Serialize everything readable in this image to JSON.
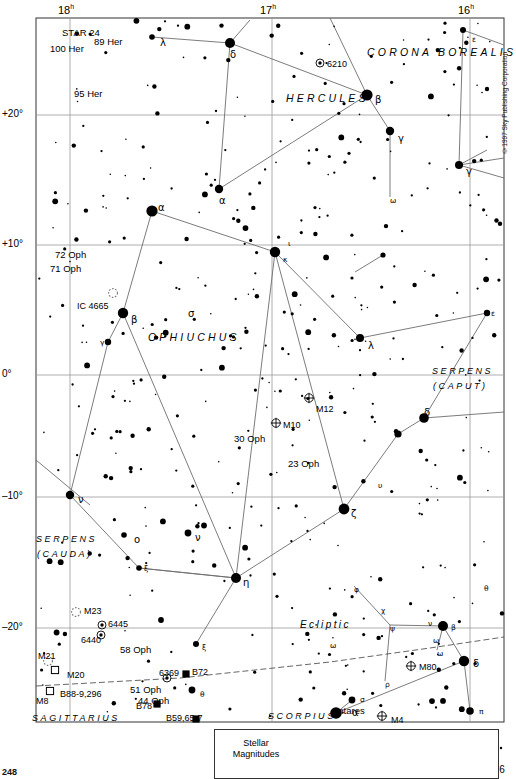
{
  "meta": {
    "copyright": "©1997 Sky Publishing Corporation",
    "page_number": "248"
  },
  "chart_data": {
    "type": "scatter",
    "xlabel": "Right Ascension",
    "ylabel": "Declination",
    "xlim": [
      "18h",
      "16h"
    ],
    "ylim": [
      -24,
      26
    ],
    "grid": true,
    "legend_position": "bottom",
    "ra_ticks": [
      {
        "label": "18",
        "unit": "h",
        "x": 70
      },
      {
        "label": "17",
        "unit": "h",
        "x": 272
      },
      {
        "label": "16",
        "unit": "h",
        "x": 470
      }
    ],
    "dec_ticks": [
      {
        "label": "+20°",
        "y": 115
      },
      {
        "label": "+10°",
        "y": 245
      },
      {
        "label": "0°",
        "y": 375
      },
      {
        "label": "–10°",
        "y": 497
      },
      {
        "label": "–20°",
        "y": 628
      }
    ],
    "magnitude_legend": {
      "title_line1": "Stellar",
      "title_line2": "Magnitudes",
      "entries": [
        {
          "label": "–1",
          "radius": 11.5,
          "cx": 296
        },
        {
          "label": "0",
          "radius": 8.0,
          "cx": 341
        },
        {
          "label": "1",
          "radius": 6.2,
          "cx": 381
        },
        {
          "label": "2",
          "radius": 4.6,
          "cx": 417
        },
        {
          "label": "3",
          "radius": 3.4,
          "cx": 448
        },
        {
          "label": "4",
          "radius": 2.4,
          "cx": 472
        },
        {
          "label": "5",
          "radius": 1.7,
          "cx": 489
        },
        {
          "label": "6",
          "radius": 1.2,
          "cx": 501
        }
      ]
    },
    "constellation_names": [
      {
        "name": "CORONA BOREALIS",
        "x": 367,
        "y": 47,
        "size": "normal"
      },
      {
        "name": "HERCULES",
        "x": 286,
        "y": 93,
        "size": "normal"
      },
      {
        "name": "OPHIUCHUS",
        "x": 148,
        "y": 332,
        "size": "normal"
      },
      {
        "name": "SERPENS",
        "x": 432,
        "y": 367,
        "size": "small"
      },
      {
        "name": "(CAPUT)",
        "x": 433,
        "y": 382,
        "size": "small"
      },
      {
        "name": "SERPENS",
        "x": 36,
        "y": 535,
        "size": "small"
      },
      {
        "name": "(CAUDA)",
        "x": 37,
        "y": 550,
        "size": "small"
      },
      {
        "name": "SAGITTARIUS",
        "x": 32,
        "y": 714,
        "size": "small"
      },
      {
        "name": "SCORPIUS",
        "x": 268,
        "y": 712,
        "size": "small"
      },
      {
        "name": "Ecliptic",
        "x": 300,
        "y": 620,
        "size": "ecliptic"
      }
    ],
    "named_stars": [
      {
        "name": "STAR 24",
        "x": 62,
        "y": 28
      },
      {
        "name": "89 Her",
        "x": 94,
        "y": 37
      },
      {
        "name": "100 Her",
        "x": 50,
        "y": 44
      },
      {
        "name": "95 Her",
        "x": 74,
        "y": 89
      },
      {
        "name": "72 Oph",
        "x": 55,
        "y": 250
      },
      {
        "name": "71 Oph",
        "x": 50,
        "y": 264
      },
      {
        "name": "30 Oph",
        "x": 234,
        "y": 434
      },
      {
        "name": "23 Oph",
        "x": 288,
        "y": 459
      },
      {
        "name": "58 Oph",
        "x": 120,
        "y": 645
      },
      {
        "name": "51 Oph",
        "x": 130,
        "y": 685
      },
      {
        "name": "44 Oph",
        "x": 138,
        "y": 696
      },
      {
        "name": "Antares",
        "x": 332,
        "y": 706
      }
    ],
    "deep_sky_objects": [
      {
        "name": "6210",
        "type": "planetary",
        "x": 320,
        "y": 63,
        "lx": 327,
        "ly": 60
      },
      {
        "name": "IC 4665",
        "type": "open-dotted",
        "x": 113,
        "y": 293,
        "lx": 77,
        "ly": 302
      },
      {
        "name": "M12",
        "type": "globular",
        "x": 309,
        "y": 398,
        "lx": 316,
        "ly": 405
      },
      {
        "name": "M10",
        "type": "globular",
        "x": 276,
        "y": 423,
        "lx": 283,
        "ly": 421
      },
      {
        "name": "M23",
        "type": "open-dotted",
        "x": 76,
        "y": 612,
        "lx": 84,
        "ly": 607
      },
      {
        "name": "6445",
        "type": "planetary",
        "x": 102,
        "y": 625,
        "lx": 108,
        "ly": 620
      },
      {
        "name": "6440",
        "type": "planetary",
        "x": 101,
        "y": 635,
        "lx": 81,
        "ly": 636
      },
      {
        "name": "M21",
        "type": "open-dotted",
        "x": 48,
        "y": 661,
        "lx": 38,
        "ly": 652
      },
      {
        "name": "M20",
        "type": "nebula",
        "x": 55,
        "y": 670,
        "lx": 67,
        "ly": 671
      },
      {
        "name": "M8",
        "type": "nebula",
        "x": 50,
        "y": 691,
        "lx": 36,
        "ly": 697
      },
      {
        "name": "B88-9,296",
        "type": "label-only",
        "x": 0,
        "y": 0,
        "lx": 60,
        "ly": 690
      },
      {
        "name": "6369",
        "type": "planetary",
        "x": 167,
        "y": 678,
        "lx": 159,
        "ly": 669
      },
      {
        "name": "B72",
        "type": "dark",
        "x": 186,
        "y": 674,
        "lx": 192,
        "ly": 668
      },
      {
        "name": "B78",
        "type": "dark",
        "x": 157,
        "y": 704,
        "lx": 136,
        "ly": 702
      },
      {
        "name": "B59,65-7",
        "type": "dark",
        "x": 196,
        "y": 719,
        "lx": 166,
        "ly": 714
      },
      {
        "name": "M80",
        "type": "globular",
        "x": 411,
        "y": 666,
        "lx": 419,
        "ly": 663
      },
      {
        "name": "M4",
        "type": "globular",
        "x": 382,
        "y": 716,
        "lx": 391,
        "ly": 716
      }
    ],
    "greek_labels": [
      {
        "g": "λ",
        "x": 160,
        "y": 38,
        "size": "n"
      },
      {
        "g": "δ",
        "x": 230,
        "y": 50,
        "size": "n"
      },
      {
        "g": "ε",
        "x": 472,
        "y": 36,
        "size": "sm"
      },
      {
        "g": "β",
        "x": 375,
        "y": 95,
        "size": "n"
      },
      {
        "g": "γ",
        "x": 398,
        "y": 134,
        "size": "n"
      },
      {
        "g": "γ",
        "x": 466,
        "y": 167,
        "size": "n"
      },
      {
        "g": "α",
        "x": 219,
        "y": 196,
        "size": "n"
      },
      {
        "g": "ω",
        "x": 390,
        "y": 197,
        "size": "sm"
      },
      {
        "g": "α",
        "x": 158,
        "y": 203,
        "size": "n"
      },
      {
        "g": "ι",
        "x": 288,
        "y": 240,
        "size": "sm"
      },
      {
        "g": "κ",
        "x": 283,
        "y": 256,
        "size": "sm"
      },
      {
        "g": "ε",
        "x": 491,
        "y": 310,
        "size": "sm"
      },
      {
        "g": "σ",
        "x": 188,
        "y": 309,
        "size": "n"
      },
      {
        "g": "β",
        "x": 131,
        "y": 315,
        "size": "n"
      },
      {
        "g": "γ",
        "x": 100,
        "y": 339,
        "size": "sm"
      },
      {
        "g": "λ",
        "x": 368,
        "y": 341,
        "size": "n"
      },
      {
        "g": "δ",
        "x": 424,
        "y": 408,
        "size": "n"
      },
      {
        "g": "ε",
        "x": 395,
        "y": 429,
        "size": "sm"
      },
      {
        "g": "υ",
        "x": 378,
        "y": 482,
        "size": "sm"
      },
      {
        "g": "ν",
        "x": 78,
        "y": 495,
        "size": "n"
      },
      {
        "g": "ζ",
        "x": 351,
        "y": 509,
        "size": "n"
      },
      {
        "g": "ν",
        "x": 195,
        "y": 533,
        "size": "n"
      },
      {
        "g": "ο",
        "x": 134,
        "y": 535,
        "size": "n"
      },
      {
        "g": "ξ",
        "x": 144,
        "y": 565,
        "size": "sm"
      },
      {
        "g": "η",
        "x": 243,
        "y": 578,
        "size": "n"
      },
      {
        "g": "φ",
        "x": 354,
        "y": 586,
        "size": "sm"
      },
      {
        "g": "θ",
        "x": 484,
        "y": 585,
        "size": "sm"
      },
      {
        "g": "χ",
        "x": 381,
        "y": 607,
        "size": "sm"
      },
      {
        "g": "ψ",
        "x": 390,
        "y": 625,
        "size": "sm"
      },
      {
        "g": "β",
        "x": 451,
        "y": 624,
        "size": "sm"
      },
      {
        "g": "ν",
        "x": 428,
        "y": 620,
        "size": "sm"
      },
      {
        "g": "ω",
        "x": 433,
        "y": 637,
        "size": "sm"
      },
      {
        "g": "ω",
        "x": 437,
        "y": 650,
        "size": "sm"
      },
      {
        "g": "δ",
        "x": 473,
        "y": 659,
        "size": "n"
      },
      {
        "g": "ξ",
        "x": 202,
        "y": 644,
        "size": "sm"
      },
      {
        "g": "ω",
        "x": 330,
        "y": 642,
        "size": "sm"
      },
      {
        "g": "ρ",
        "x": 385,
        "y": 681,
        "size": "sm"
      },
      {
        "g": "θ",
        "x": 200,
        "y": 691,
        "size": "sm"
      },
      {
        "g": "σ",
        "x": 360,
        "y": 696,
        "size": "sm"
      },
      {
        "g": "α",
        "x": 352,
        "y": 708,
        "size": "n"
      },
      {
        "g": "π",
        "x": 479,
        "y": 708,
        "size": "sm"
      }
    ],
    "bright_stars": [
      {
        "x": 230,
        "y": 43,
        "r": 5.0
      },
      {
        "x": 367,
        "y": 95,
        "r": 5.6
      },
      {
        "x": 390,
        "y": 131,
        "r": 4.2
      },
      {
        "x": 459,
        "y": 165,
        "r": 4.0
      },
      {
        "x": 463,
        "y": 30,
        "r": 3.0
      },
      {
        "x": 152,
        "y": 37,
        "r": 2.8
      },
      {
        "x": 219,
        "y": 189,
        "r": 4.2
      },
      {
        "x": 152,
        "y": 211,
        "r": 5.6
      },
      {
        "x": 275,
        "y": 252,
        "r": 5.2
      },
      {
        "x": 123,
        "y": 313,
        "r": 5.2
      },
      {
        "x": 108,
        "y": 342,
        "r": 3.2
      },
      {
        "x": 360,
        "y": 338,
        "r": 4.0
      },
      {
        "x": 424,
        "y": 418,
        "r": 4.8
      },
      {
        "x": 398,
        "y": 434,
        "r": 3.6
      },
      {
        "x": 344,
        "y": 509,
        "r": 5.4
      },
      {
        "x": 70,
        "y": 495,
        "r": 4.2
      },
      {
        "x": 236,
        "y": 578,
        "r": 5.0
      },
      {
        "x": 188,
        "y": 533,
        "r": 3.4
      },
      {
        "x": 124,
        "y": 535,
        "r": 2.8
      },
      {
        "x": 139,
        "y": 568,
        "r": 2.8
      },
      {
        "x": 443,
        "y": 626,
        "r": 5.0
      },
      {
        "x": 464,
        "y": 661,
        "r": 5.2
      },
      {
        "x": 470,
        "y": 711,
        "r": 3.8
      },
      {
        "x": 336,
        "y": 713,
        "r": 5.8
      },
      {
        "x": 352,
        "y": 700,
        "r": 3.4
      },
      {
        "x": 192,
        "y": 690,
        "r": 3.4
      },
      {
        "x": 196,
        "y": 644,
        "r": 3.0
      },
      {
        "x": 383,
        "y": 255,
        "r": 2.6
      },
      {
        "x": 487,
        "y": 313,
        "r": 3.2
      }
    ]
  }
}
